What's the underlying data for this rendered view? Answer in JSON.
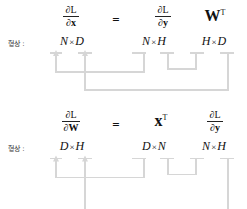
{
  "diagram": {
    "title_text": "",
    "shape_label": "형상 :",
    "line_color": "#d6d6d6",
    "text_color": "#111111",
    "background": "#ffffff",
    "equations": [
      {
        "id": "dx",
        "terms": [
          {
            "kind": "fraction",
            "numerator": "∂L",
            "denominator_partial": "∂",
            "denominator_symbol": "x",
            "bold_denominator": true
          },
          {
            "kind": "operator",
            "text": "="
          },
          {
            "kind": "fraction",
            "numerator": "∂L",
            "denominator_partial": "∂",
            "denominator_symbol": "y",
            "bold_denominator": true
          },
          {
            "kind": "matrix",
            "symbol": "W",
            "superscript": "T"
          }
        ],
        "shapes": [
          {
            "left": "N",
            "times": "×",
            "right": "D"
          },
          {
            "left": "N",
            "times": "×",
            "right": "H"
          },
          {
            "left": "H",
            "times": "×",
            "right": "D"
          }
        ]
      },
      {
        "id": "dW",
        "terms": [
          {
            "kind": "fraction",
            "numerator": "∂L",
            "denominator_partial": "∂",
            "denominator_symbol": "W",
            "bold_denominator": true
          },
          {
            "kind": "operator",
            "text": "="
          },
          {
            "kind": "matrix",
            "symbol": "x",
            "superscript": "T"
          },
          {
            "kind": "fraction",
            "numerator": "∂L",
            "denominator_partial": "∂",
            "denominator_symbol": "y",
            "bold_denominator": true
          }
        ],
        "shapes": [
          {
            "left": "D",
            "times": "×",
            "right": "H"
          },
          {
            "left": "D",
            "times": "×",
            "right": "N"
          },
          {
            "left": "N",
            "times": "×",
            "right": "H"
          }
        ]
      }
    ]
  }
}
